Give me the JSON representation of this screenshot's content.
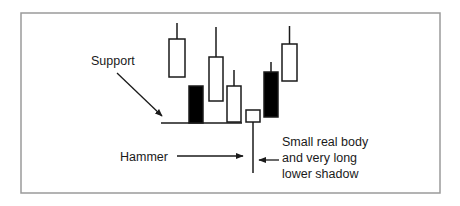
{
  "diagram": {
    "frame": {
      "x": 21,
      "y": 13,
      "w": 419,
      "h": 180,
      "stroke": "#9a9a9a"
    },
    "colors": {
      "ink": "#1a1a1a",
      "bullish_fill": "#ffffff",
      "bearish_fill": "#000000"
    },
    "support_line": {
      "x1": 161,
      "x2": 242,
      "y": 123
    },
    "candles": [
      {
        "name": "candle-1",
        "type": "bullish",
        "x": 169,
        "w": 16,
        "body_top": 39,
        "body_bottom": 77,
        "wick_top": 23,
        "wick_bottom": 39
      },
      {
        "name": "candle-2",
        "type": "bearish",
        "x": 189,
        "w": 14,
        "body_top": 86,
        "body_bottom": 123,
        "wick_top": 86,
        "wick_bottom": 123
      },
      {
        "name": "candle-3",
        "type": "bullish",
        "x": 209,
        "w": 14,
        "body_top": 57,
        "body_bottom": 101,
        "wick_top": 27,
        "wick_bottom": 57
      },
      {
        "name": "candle-4",
        "type": "bullish",
        "x": 227,
        "w": 14,
        "body_top": 86,
        "body_bottom": 122,
        "wick_top": 70,
        "wick_bottom": 86
      },
      {
        "name": "hammer-candle",
        "type": "bullish",
        "x": 246,
        "w": 14,
        "body_top": 110,
        "body_bottom": 122,
        "wick_top": 122,
        "wick_bottom": 173
      },
      {
        "name": "candle-6",
        "type": "bearish",
        "x": 264,
        "w": 14,
        "body_top": 72,
        "body_bottom": 117,
        "wick_top": 62,
        "wick_bottom": 72
      },
      {
        "name": "candle-7",
        "type": "bullish",
        "x": 282,
        "w": 15,
        "body_top": 44,
        "body_bottom": 81,
        "wick_top": 26,
        "wick_bottom": 44
      }
    ],
    "arrows": [
      {
        "name": "support-arrow",
        "x1": 117,
        "y1": 73,
        "x2": 162,
        "y2": 116
      },
      {
        "name": "hammer-arrow",
        "x1": 177,
        "y1": 156,
        "x2": 243,
        "y2": 156
      },
      {
        "name": "shadow-arrow",
        "x1": 279,
        "y1": 160,
        "x2": 259,
        "y2": 160
      }
    ],
    "labels": {
      "support": "Support",
      "hammer": "Hammer",
      "description_line1": "Small real body",
      "description_line2": "and very long",
      "description_line3": "lower shadow"
    }
  }
}
